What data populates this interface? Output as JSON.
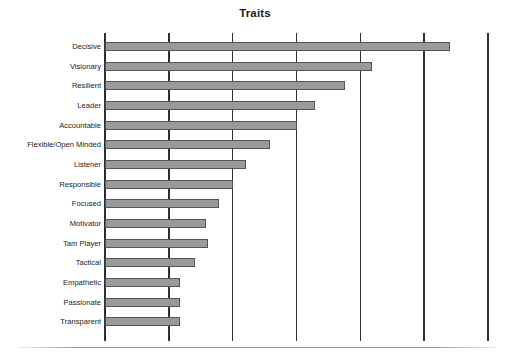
{
  "chart_data": {
    "type": "bar",
    "orientation": "horizontal",
    "title": "Traits",
    "xlabel": "",
    "ylabel": "",
    "grid": true,
    "legend": false,
    "xlim": [
      0,
      6
    ],
    "xticks": [
      0,
      1,
      2,
      3,
      4,
      5,
      6
    ],
    "categories": [
      "Decisive",
      "Visionary",
      "Resilient",
      "Leader",
      "Accountable",
      "Flexible/Open Minded",
      "Listener",
      "Responsible",
      "Focused",
      "Motivator",
      "Tam Player",
      "Tactical",
      "Empathetic",
      "Passionate",
      "Transparent"
    ],
    "values": [
      5.41,
      4.18,
      3.76,
      3.29,
      3.0,
      2.59,
      2.21,
      2.0,
      1.78,
      1.59,
      1.61,
      1.41,
      1.18,
      1.18,
      1.18
    ],
    "bar_color": "#9a9a9a",
    "bar_edge_color": "#545454",
    "axis_color": "#2e2e2e",
    "background": "#ffffff"
  },
  "labels": {
    "row0": "Decisive",
    "row1": "Visionary",
    "row2": "Resilient",
    "row3": "Leader",
    "row4": "Accountable",
    "row5": "Flexible/Open Minded",
    "row6": "Listener",
    "row7": "Responsible",
    "row8": "Focused",
    "row9": "Motivator",
    "row10": "Tam Player",
    "row11": "Tactical",
    "row12": "Empathetic",
    "row13": "Passionate",
    "row14": "Transparent"
  },
  "title": "Traits"
}
